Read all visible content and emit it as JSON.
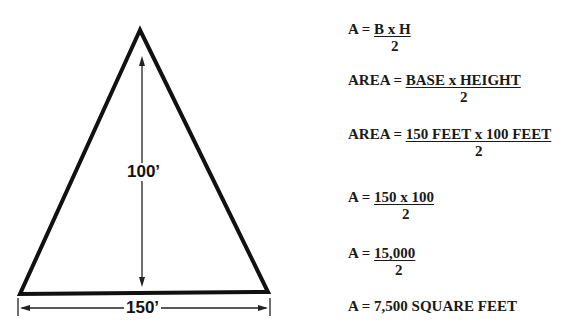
{
  "diagram": {
    "shape": "triangle",
    "height_label": "100’",
    "base_label": "150’",
    "stroke_color": "#111111"
  },
  "formulas": [
    {
      "lhs": "A = ",
      "numerator": "B x H",
      "denominator": "2"
    },
    {
      "lhs": "AREA = ",
      "numerator": "BASE x HEIGHT",
      "denominator": "2"
    },
    {
      "lhs": "AREA = ",
      "numerator": "150 FEET x 100 FEET",
      "denominator": "2"
    },
    {
      "lhs": "A = ",
      "numerator": "150 x 100",
      "denominator": "2"
    },
    {
      "lhs": "A = ",
      "numerator": "15,000",
      "denominator": "2"
    }
  ],
  "result": "A = 7,500 SQUARE FEET"
}
